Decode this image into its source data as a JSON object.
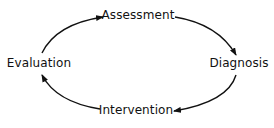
{
  "diagram": {
    "type": "cycle",
    "nodes": [
      {
        "id": "assessment",
        "label": "Assessment",
        "x": 138,
        "y": 15
      },
      {
        "id": "diagnosis",
        "label": "Diagnosis",
        "x": 239,
        "y": 63
      },
      {
        "id": "intervention",
        "label": "Intervention",
        "x": 136,
        "y": 110
      },
      {
        "id": "evaluation",
        "label": "Evaluation",
        "x": 39,
        "y": 63
      }
    ],
    "edges": [
      {
        "from": "assessment",
        "to": "diagnosis"
      },
      {
        "from": "diagnosis",
        "to": "intervention"
      },
      {
        "from": "intervention",
        "to": "evaluation"
      },
      {
        "from": "evaluation",
        "to": "assessment"
      }
    ],
    "colors": {
      "stroke": "#111111",
      "text": "#111111",
      "background": "#ffffff"
    }
  }
}
